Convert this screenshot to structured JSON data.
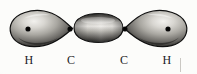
{
  "figure": {
    "background_color": "#fcfcfa",
    "ink_color": "#1a1a1a",
    "molecule": "H-C≡C-H",
    "labels": [
      {
        "text": "H",
        "name": "label-hydrogen-left",
        "x": 29,
        "y": 4
      },
      {
        "text": "C",
        "name": "label-carbon-left",
        "x": 71,
        "y": 4
      },
      {
        "text": "C",
        "name": "label-carbon-right",
        "x": 124,
        "y": 4
      },
      {
        "text": "H",
        "name": "label-hydrogen-right",
        "x": 167,
        "y": 4
      }
    ],
    "nuclei": [
      {
        "name": "nucleus-dot-hydrogen-left",
        "cx": 28,
        "cy": 29,
        "r": 2.6
      },
      {
        "name": "nucleus-dot-carbon-left",
        "cx": 70,
        "cy": 29,
        "r": 2.6
      },
      {
        "name": "nucleus-dot-carbon-right",
        "cx": 125,
        "cy": 29,
        "r": 2.6
      },
      {
        "name": "nucleus-dot-hydrogen-right",
        "cx": 168,
        "cy": 29,
        "r": 2.6
      }
    ],
    "lobes": [
      {
        "name": "orbital-lobe-left",
        "description": "teardrop lobe pointing right, C-H sigma bond"
      },
      {
        "name": "orbital-lobe-center",
        "description": "elongated ellipse, C-C sigma bond"
      },
      {
        "name": "orbital-lobe-right",
        "description": "teardrop lobe pointing left, C-H sigma bond"
      }
    ],
    "artifact": {
      "name": "scan-artifact-line",
      "x": 180,
      "y": 58,
      "w": 1,
      "h": 14
    }
  }
}
